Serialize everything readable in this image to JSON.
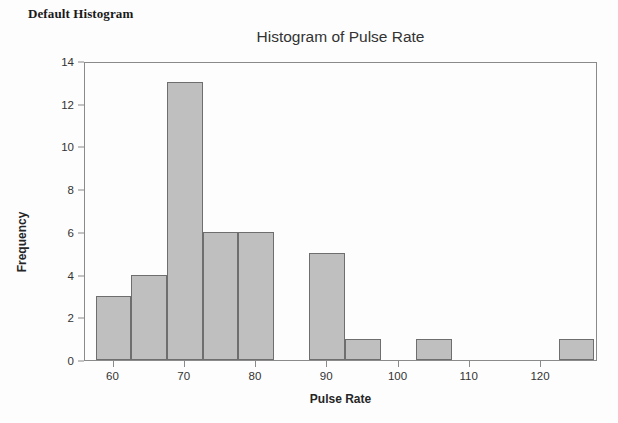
{
  "page": {
    "heading": "Default Histogram"
  },
  "chart_data": {
    "type": "bar",
    "title": "Histogram of Pulse Rate",
    "xlabel": "Pulse Rate",
    "ylabel": "Frequency",
    "xlim": [
      56,
      128
    ],
    "ylim": [
      0,
      14
    ],
    "xticks": [
      60,
      70,
      80,
      90,
      100,
      110,
      120
    ],
    "yticks": [
      0,
      2,
      4,
      6,
      8,
      10,
      12,
      14
    ],
    "xtick_labels": [
      "60",
      "70",
      "80",
      "90",
      "100",
      "110",
      "120"
    ],
    "ytick_labels": [
      "0",
      "2",
      "4",
      "6",
      "8",
      "10",
      "12",
      "14"
    ],
    "grid": false,
    "legend": null,
    "bin_width": 5,
    "bin_edges": [
      57.5,
      62.5,
      67.5,
      72.5,
      77.5,
      82.5,
      87.5,
      92.5,
      97.5,
      102.5,
      107.5,
      112.5,
      117.5,
      122.5,
      127.5
    ],
    "categories": [
      "57.5-62.5",
      "62.5-67.5",
      "67.5-72.5",
      "72.5-77.5",
      "77.5-82.5",
      "82.5-87.5",
      "87.5-92.5",
      "92.5-97.5",
      "97.5-102.5",
      "102.5-107.5",
      "107.5-112.5",
      "112.5-117.5",
      "117.5-122.5",
      "122.5-127.5"
    ],
    "values": [
      3,
      4,
      13,
      6,
      6,
      0,
      5,
      1,
      0,
      1,
      0,
      0,
      0,
      1
    ],
    "bar_fill_color": "#bfbfbf",
    "bar_border_color": "#6e6e6e",
    "axis_color": "#8a8a8a",
    "text_color": "#333333"
  }
}
